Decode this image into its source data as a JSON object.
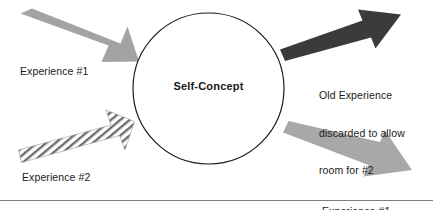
{
  "diagram": {
    "center_node": {
      "label": "Self-Concept",
      "shape": "circle",
      "stroke_color": "#1b1b1b",
      "fill_color": "#ffffff"
    },
    "arrows": [
      {
        "name": "incoming-experience-1",
        "label": "Experience #1",
        "style": "solid-gray",
        "color": "#a0a0a0",
        "direction": "down-right",
        "from": "upper-left",
        "to": "center-node"
      },
      {
        "name": "incoming-experience-2",
        "label": "Experience #2",
        "style": "hatched",
        "color": "#6e6e6e",
        "direction": "up-right",
        "from": "lower-left",
        "to": "center-node"
      },
      {
        "name": "outgoing-old-experience",
        "label": "Old Experience\ndiscarded to allow\nroom for #2",
        "style": "solid-dark",
        "color": "#3a3a3a",
        "direction": "up-right",
        "from": "center-node",
        "to": "upper-right"
      },
      {
        "name": "outgoing-experience-1-rejected",
        "label": "Experience #1\nrejected",
        "style": "solid-gray",
        "color": "#a8a8a8",
        "direction": "down-right",
        "from": "center-node",
        "to": "lower-right"
      }
    ],
    "labels": {
      "experience_1": "Experience #1",
      "experience_2": "Experience #2",
      "old_experience_line_1": "Old Experience",
      "old_experience_line_2": "discarded to allow",
      "old_experience_line_3": "room for #2",
      "experience_1_rejected_line_1": "Experience #1",
      "experience_1_rejected_line_2": "rejected"
    },
    "footer_rule": {
      "name": "bottom-divider",
      "color": "#7a7a7a"
    }
  }
}
